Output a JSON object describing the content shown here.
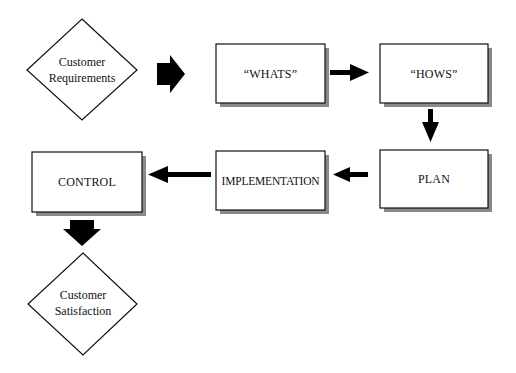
{
  "diagram": {
    "nodes": [
      {
        "id": "customer-requirements",
        "shape": "diamond",
        "lines": [
          "Customer",
          "Requirements"
        ]
      },
      {
        "id": "whats",
        "shape": "box",
        "label": "“WHATS”"
      },
      {
        "id": "hows",
        "shape": "box",
        "label": "“HOWS”"
      },
      {
        "id": "plan",
        "shape": "box",
        "label": "PLAN"
      },
      {
        "id": "implementation",
        "shape": "box",
        "label": "IMPLEMENTATION"
      },
      {
        "id": "control",
        "shape": "box",
        "label": "CONTROL"
      },
      {
        "id": "customer-satisfaction",
        "shape": "diamond",
        "lines": [
          "Customer",
          "Satisfaction"
        ]
      }
    ],
    "edges": [
      {
        "from": "customer-requirements",
        "to": "whats",
        "style": "block-arrow"
      },
      {
        "from": "whats",
        "to": "hows",
        "style": "arrow"
      },
      {
        "from": "hows",
        "to": "plan",
        "style": "arrow"
      },
      {
        "from": "plan",
        "to": "implementation",
        "style": "arrow"
      },
      {
        "from": "implementation",
        "to": "control",
        "style": "arrow"
      },
      {
        "from": "control",
        "to": "customer-satisfaction",
        "style": "block-arrow"
      }
    ],
    "colors": {
      "stroke": "#111111",
      "fill": "#ffffff",
      "shadow": "#8a8a8a"
    }
  }
}
